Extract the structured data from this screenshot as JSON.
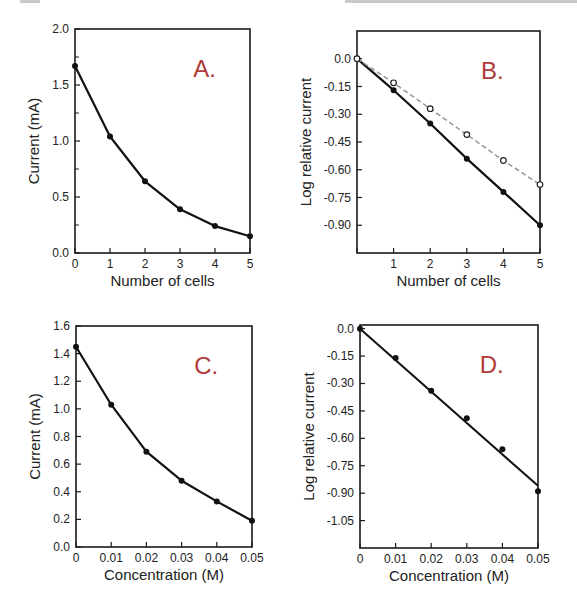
{
  "colors": {
    "panel_label": "#b03a3a",
    "line": "#111111",
    "dashed_line": "#999999",
    "frame": "#1a1a1a"
  },
  "chart_data": [
    {
      "id": "A",
      "type": "line",
      "panel_label": "A.",
      "title": "",
      "xlabel": "Number of cells",
      "ylabel": "Current (mA)",
      "x": [
        0,
        1,
        2,
        3,
        4,
        5
      ],
      "xticks": [
        "0",
        "1",
        "2",
        "3",
        "4",
        "5"
      ],
      "yticks": [
        "0.0",
        "0.5",
        "1.0",
        "1.5",
        "2.0"
      ],
      "ytick_values": [
        0,
        0.5,
        1.0,
        1.5,
        2.0
      ],
      "xlim": [
        0,
        5
      ],
      "ylim": [
        0,
        2.0
      ],
      "grid": false,
      "series": [
        {
          "name": "current",
          "style": "solid-filled",
          "values": [
            1.67,
            1.04,
            0.64,
            0.39,
            0.24,
            0.15
          ]
        }
      ],
      "frame": {
        "left": 75,
        "top": 29,
        "right": 250,
        "bottom": 253
      }
    },
    {
      "id": "B",
      "type": "line",
      "panel_label": "B.",
      "title": "",
      "xlabel": "Number of cells",
      "ylabel": "Log relative current",
      "x": [
        0,
        1,
        2,
        3,
        4,
        5
      ],
      "xticks": [
        "",
        "1",
        "2",
        "3",
        "4",
        "5"
      ],
      "yticks": [
        "0.0",
        "-0.15",
        "-0.30",
        "-0.45",
        "-0.60",
        "-0.75",
        "-0.90"
      ],
      "ytick_values": [
        0,
        -0.15,
        -0.3,
        -0.45,
        -0.6,
        -0.75,
        -0.9
      ],
      "xlim": [
        0,
        5
      ],
      "ylim": [
        -1.05,
        0.15
      ],
      "grid": false,
      "series": [
        {
          "name": "filled",
          "style": "solid-filled",
          "values": [
            0.0,
            -0.17,
            -0.35,
            -0.54,
            -0.72,
            -0.9
          ]
        },
        {
          "name": "open",
          "style": "dashed-open",
          "values": [
            0.0,
            -0.13,
            -0.27,
            -0.41,
            -0.55,
            -0.68
          ]
        }
      ],
      "frame": {
        "left": 357,
        "top": 31,
        "right": 540,
        "bottom": 253
      }
    },
    {
      "id": "C",
      "type": "line",
      "panel_label": "C.",
      "title": "",
      "xlabel": "Concentration (M)",
      "ylabel": "Current (mA)",
      "x": [
        0,
        0.01,
        0.02,
        0.03,
        0.04,
        0.05
      ],
      "xticks": [
        "0",
        "0.01",
        "0.02",
        "0.03",
        "0.04",
        "0.05"
      ],
      "yticks": [
        "0.0",
        "0.2",
        "0.4",
        "0.6",
        "0.8",
        "1.0",
        "1.2",
        "1.4",
        "1.6"
      ],
      "ytick_values": [
        0,
        0.2,
        0.4,
        0.6,
        0.8,
        1.0,
        1.2,
        1.4,
        1.6
      ],
      "xlim": [
        0,
        0.05
      ],
      "ylim": [
        0,
        1.6
      ],
      "grid": false,
      "series": [
        {
          "name": "current",
          "style": "solid-filled",
          "values": [
            1.45,
            1.03,
            0.69,
            0.48,
            0.33,
            0.19
          ]
        }
      ],
      "frame": {
        "left": 76,
        "top": 326,
        "right": 252,
        "bottom": 547
      }
    },
    {
      "id": "D",
      "type": "scatter",
      "panel_label": "D.",
      "title": "",
      "xlabel": "Concentration (M)",
      "ylabel": "Log relative current",
      "x": [
        0,
        0.01,
        0.02,
        0.03,
        0.04,
        0.05
      ],
      "xticks": [
        "0",
        "0.01",
        "0.02",
        "0.03",
        "0.04",
        "0.05"
      ],
      "yticks": [
        "0.0",
        "-0.15",
        "-0.30",
        "-0.45",
        "-0.60",
        "-0.75",
        "-0.90",
        "-1.05"
      ],
      "ytick_values": [
        0,
        -0.15,
        -0.3,
        -0.45,
        -0.6,
        -0.75,
        -0.9,
        -1.05
      ],
      "xlim": [
        0,
        0.05
      ],
      "ylim": [
        -1.2,
        0.02
      ],
      "grid": false,
      "series": [
        {
          "name": "measured",
          "style": "points-filled",
          "values": [
            0.0,
            -0.16,
            -0.34,
            -0.49,
            -0.66,
            -0.89
          ]
        }
      ],
      "fit_line": {
        "x": [
          0,
          0.05
        ],
        "y": [
          0.0,
          -0.86
        ]
      },
      "frame": {
        "left": 360,
        "top": 325,
        "right": 538,
        "bottom": 548
      }
    }
  ]
}
